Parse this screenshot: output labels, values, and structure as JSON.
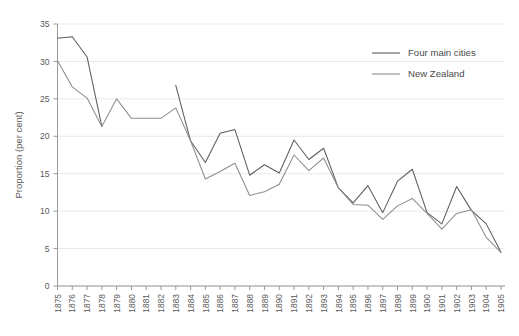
{
  "chart_data": {
    "type": "line",
    "title": "",
    "xlabel": "",
    "ylabel": "Proportion (per cent)",
    "ylim": [
      0,
      35
    ],
    "yticks": [
      0,
      5,
      10,
      15,
      20,
      25,
      30,
      35
    ],
    "grid": true,
    "legend_position": "top-right",
    "x": [
      1875,
      1876,
      1877,
      1878,
      1879,
      1880,
      1881,
      1882,
      1883,
      1884,
      1885,
      1886,
      1887,
      1888,
      1889,
      1890,
      1891,
      1892,
      1893,
      1894,
      1895,
      1896,
      1897,
      1898,
      1899,
      1900,
      1901,
      1902,
      1903,
      1904,
      1905
    ],
    "categories": [
      "1875",
      "1876",
      "1877",
      "1878",
      "1879",
      "1880",
      "1881",
      "1882",
      "1883",
      "1884",
      "1885",
      "1886",
      "1887",
      "1888",
      "1889",
      "1890",
      "1891",
      "1892",
      "1893",
      "1894",
      "1895",
      "1896",
      "1897",
      "1898",
      "1899",
      "1900",
      "1901",
      "1902",
      "1903",
      "1904",
      "1905"
    ],
    "series": [
      {
        "name": "Four main cities",
        "color": "#5c5c5c",
        "values": [
          33.1,
          33.3,
          30.6,
          21.3,
          null,
          null,
          null,
          null,
          26.8,
          19.4,
          16.5,
          20.4,
          20.9,
          14.8,
          16.2,
          15.1,
          19.5,
          16.9,
          18.4,
          13.1,
          11.1,
          13.4,
          9.8,
          14.0,
          15.6,
          9.8,
          8.3,
          13.3,
          10.1,
          8.3,
          4.5
        ],
        "note": "Series begins 1875-1878, resumes 1883-1905"
      },
      {
        "name": "New Zealand",
        "color": "#8e8e8e",
        "values": [
          30.1,
          26.6,
          25.1,
          21.3,
          25.0,
          22.4,
          22.4,
          22.4,
          23.8,
          19.4,
          14.3,
          15.3,
          16.4,
          12.1,
          12.6,
          13.6,
          17.5,
          15.4,
          17.1,
          13.1,
          10.9,
          10.8,
          8.9,
          10.7,
          11.7,
          9.7,
          7.6,
          9.7,
          10.2,
          6.5,
          4.5
        ]
      }
    ]
  },
  "legend": {
    "items": [
      {
        "label": "Four main cities"
      },
      {
        "label": "New Zealand"
      }
    ]
  },
  "axes": {
    "y_label": "Proportion (per cent)",
    "y_tick_labels": [
      "0",
      "5",
      "10",
      "15",
      "20",
      "25",
      "30",
      "35"
    ],
    "x_tick_labels": [
      "1875",
      "1876",
      "1877",
      "1878",
      "1879",
      "1880",
      "1881",
      "1882",
      "1883",
      "1884",
      "1885",
      "1886",
      "1887",
      "1888",
      "1889",
      "1890",
      "1891",
      "1892",
      "1893",
      "1894",
      "1895",
      "1896",
      "1897",
      "1898",
      "1899",
      "1900",
      "1901",
      "1902",
      "1903",
      "1904",
      "1905"
    ]
  },
  "colors": {
    "series_cities": "#5c5c5c",
    "series_nz": "#8e8e8e",
    "grid": "#e9e9e9",
    "axis": "#9a9a9a",
    "text": "#5a5a5a",
    "background": "#ffffff"
  }
}
